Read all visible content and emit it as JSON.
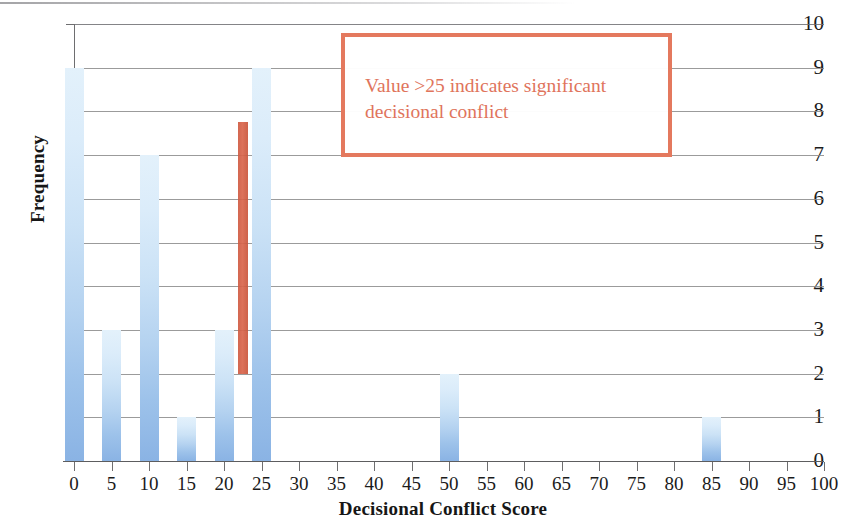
{
  "chart_data": {
    "type": "bar",
    "title": "",
    "subtitle": "",
    "xlabel": "Decisional Conflict Score",
    "ylabel": "Frequency",
    "categories": [
      0,
      5,
      10,
      15,
      20,
      25,
      30,
      35,
      40,
      45,
      50,
      55,
      60,
      65,
      70,
      75,
      80,
      85,
      90,
      95,
      100
    ],
    "values": [
      9,
      3,
      7,
      1,
      3,
      9,
      0,
      0,
      0,
      0,
      2,
      0,
      0,
      0,
      0,
      0,
      0,
      1,
      0,
      0,
      0
    ],
    "xlim": [
      0,
      100
    ],
    "ylim": [
      0,
      10
    ],
    "x_tick_labels": [
      "0",
      "5",
      "10",
      "15",
      "20",
      "25",
      "30",
      "35",
      "40",
      "45",
      "50",
      "55",
      "60",
      "65",
      "70",
      "75",
      "80",
      "85",
      "90",
      "95",
      "100"
    ],
    "y_tick_labels": [
      "0",
      "1",
      "2",
      "3",
      "4",
      "5",
      "6",
      "7",
      "8",
      "9",
      "10"
    ],
    "y_ticks": [
      0,
      1,
      2,
      3,
      4,
      5,
      6,
      7,
      8,
      9,
      10
    ],
    "grid": "horizontal",
    "legend": "none",
    "bar_color_top": "#e3f1fb",
    "bar_color_bottom": "#8ab3e4",
    "annotations": [
      {
        "kind": "text-box",
        "text": "Value  >25 indicates significant decisional conflict",
        "color": "#e0745c",
        "border_color": "#e4795e"
      },
      {
        "kind": "threshold-marker",
        "x_value": 22.5,
        "y_start": 2,
        "y_end": 7.75,
        "color": "#d1563c"
      }
    ]
  },
  "axes": {
    "y_title": "Frequency",
    "x_title": "Decisional Conflict Score"
  },
  "annotation": {
    "line1": "Value  >25 indicates significant",
    "line2": "decisional conflict",
    "full_text": "Value  >25 indicates significant decisional conflict"
  }
}
